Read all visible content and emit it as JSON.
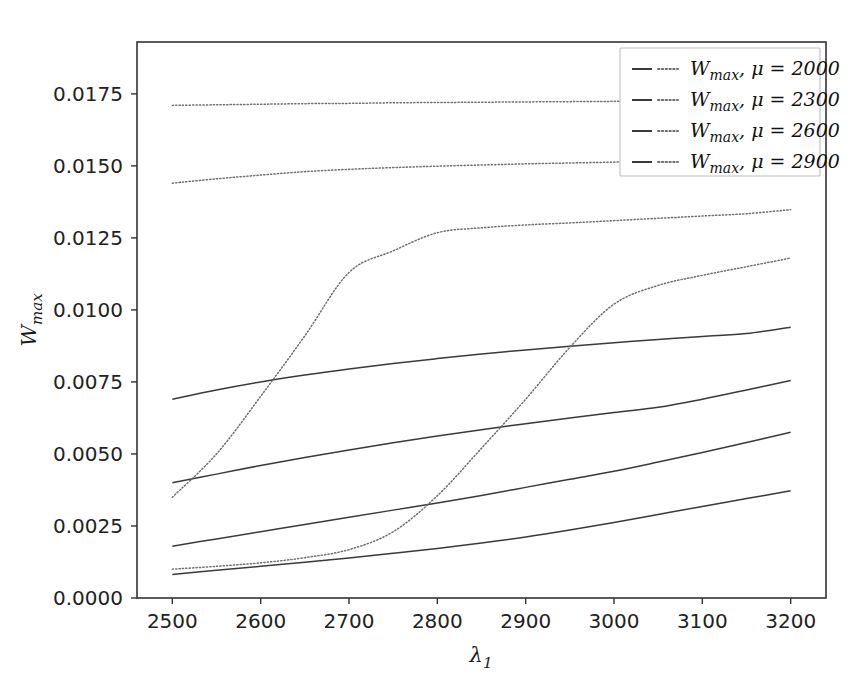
{
  "chart_data": {
    "type": "line",
    "title": "",
    "xlabel": "λ₁",
    "ylabel": "W_max",
    "xlim": [
      2460,
      3240
    ],
    "ylim": [
      0.0,
      0.0193
    ],
    "grid": false,
    "legend_position": "upper right",
    "x_ticks": [
      2500,
      2600,
      2700,
      2800,
      2900,
      3000,
      3100,
      3200
    ],
    "x_tick_labels": [
      "2500",
      "2600",
      "2700",
      "2800",
      "2900",
      "3000",
      "3100",
      "3200"
    ],
    "y_ticks": [
      0.0,
      0.0025,
      0.005,
      0.0075,
      0.01,
      0.0125,
      0.015,
      0.0175
    ],
    "y_tick_labels": [
      "0.0000",
      "0.0025",
      "0.0050",
      "0.0075",
      "0.0100",
      "0.0125",
      "0.0150",
      "0.0175"
    ],
    "x": [
      2500,
      2550,
      2600,
      2650,
      2700,
      2750,
      2800,
      2850,
      2900,
      2950,
      3000,
      3050,
      3100,
      3150,
      3200
    ],
    "series": [
      {
        "name": "W_max, μ = 2000 (solid)",
        "style": "solid",
        "color": "#3a3a3a",
        "values": [
          0.0069,
          0.00722,
          0.0075,
          0.00774,
          0.00795,
          0.00814,
          0.00831,
          0.00847,
          0.00861,
          0.00874,
          0.00886,
          0.00897,
          0.00908,
          0.00918,
          0.0094
        ]
      },
      {
        "name": "W_max, μ = 2300 (solid)",
        "style": "solid",
        "color": "#3a3a3a",
        "values": [
          0.004,
          0.0043,
          0.0046,
          0.00488,
          0.00514,
          0.00539,
          0.00562,
          0.00584,
          0.00605,
          0.00625,
          0.00644,
          0.00662,
          0.0069,
          0.00722,
          0.00755
        ]
      },
      {
        "name": "W_max, μ = 2600 (solid)",
        "style": "solid",
        "color": "#3a3a3a",
        "values": [
          0.0018,
          0.00205,
          0.0023,
          0.00255,
          0.0028,
          0.00305,
          0.0033,
          0.00356,
          0.00384,
          0.00412,
          0.0044,
          0.00472,
          0.00505,
          0.0054,
          0.00575
        ]
      },
      {
        "name": "W_max, μ = 2900 (solid)",
        "style": "solid",
        "color": "#3a3a3a",
        "values": [
          0.00082,
          0.00096,
          0.0011,
          0.00124,
          0.00139,
          0.00155,
          0.00172,
          0.00191,
          0.00212,
          0.00236,
          0.00262,
          0.0029,
          0.00318,
          0.00345,
          0.00372
        ]
      },
      {
        "name": "W_max, μ = 2000 (dotted)",
        "style": "dotted",
        "color": "#6e6e6e",
        "values": [
          0.0171,
          0.01712,
          0.01714,
          0.01716,
          0.01717,
          0.01719,
          0.0172,
          0.01721,
          0.01722,
          0.01723,
          0.01724,
          0.01725,
          0.01726,
          0.01727,
          0.01728
        ]
      },
      {
        "name": "W_max, μ = 2300 (dotted)",
        "style": "dotted",
        "color": "#6e6e6e",
        "values": [
          0.0144,
          0.01455,
          0.01468,
          0.0148,
          0.01488,
          0.01494,
          0.01499,
          0.01503,
          0.01507,
          0.0151,
          0.01513,
          0.01516,
          0.01519,
          0.01521,
          0.01524
        ]
      },
      {
        "name": "W_max, μ = 2600 (dotted)",
        "style": "dotted",
        "color": "#6e6e6e",
        "values": [
          0.0035,
          0.005,
          0.007,
          0.0091,
          0.0113,
          0.01205,
          0.01268,
          0.01285,
          0.01295,
          0.01302,
          0.0131,
          0.01318,
          0.01326,
          0.01334,
          0.01348
        ]
      },
      {
        "name": "W_max, μ = 2900 (dotted)",
        "style": "dotted",
        "color": "#6e6e6e",
        "values": [
          0.001,
          0.0011,
          0.00122,
          0.0014,
          0.00168,
          0.0023,
          0.00355,
          0.0052,
          0.0069,
          0.0087,
          0.0102,
          0.01085,
          0.0112,
          0.0115,
          0.0118
        ]
      }
    ],
    "legend_entries": [
      "W_max, μ = 2000",
      "W_max, μ = 2300",
      "W_max, μ = 2600",
      "W_max, μ = 2900"
    ],
    "legend_labels_parts": [
      {
        "sym": "W",
        "sub": "max",
        "rest": ", μ = 2000"
      },
      {
        "sym": "W",
        "sub": "max",
        "rest": ", μ = 2300"
      },
      {
        "sym": "W",
        "sub": "max",
        "rest": ", μ = 2600"
      },
      {
        "sym": "W",
        "sub": "max",
        "rest": ", μ = 2900"
      }
    ],
    "ylabel_parts": {
      "sym": "W",
      "sub": "max"
    },
    "xlabel_parts": {
      "sym": "λ",
      "sub": "1"
    }
  },
  "axes": {
    "x_tick_labels": [
      "2500",
      "2600",
      "2700",
      "2800",
      "2900",
      "3000",
      "3100",
      "3200"
    ],
    "y_tick_labels": [
      "0.0000",
      "0.0025",
      "0.0050",
      "0.0075",
      "0.0100",
      "0.0125",
      "0.0150",
      "0.0175"
    ]
  },
  "colors": {
    "solid": "#3a3a3a",
    "dotted": "#6e6e6e",
    "spine": "#333333",
    "legend_border": "#bdbdbd",
    "background": "#ffffff"
  }
}
